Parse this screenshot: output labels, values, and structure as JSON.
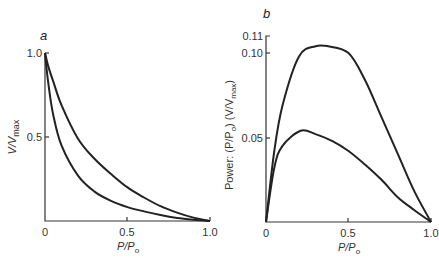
{
  "chart_data": [
    {
      "type": "line",
      "panel": "a",
      "title": "",
      "xlabel": "P/P₀",
      "ylabel": "V/V_max",
      "xlim": [
        0,
        1.0
      ],
      "ylim": [
        0,
        1.0
      ],
      "xticks": [
        "0",
        "0.5",
        "1.0"
      ],
      "yticks": [
        "0.5",
        "1.0"
      ],
      "grid": false,
      "series": [
        {
          "name": "upper curve (a≈0.33)",
          "x": [
            0,
            0.02,
            0.05,
            0.1,
            0.2,
            0.3,
            0.4,
            0.5,
            0.6,
            0.7,
            0.8,
            0.9,
            1.0
          ],
          "values": [
            1.0,
            0.92,
            0.83,
            0.69,
            0.49,
            0.37,
            0.28,
            0.2,
            0.14,
            0.088,
            0.05,
            0.02,
            0
          ]
        },
        {
          "name": "lower curve (a≈0.1)",
          "x": [
            0,
            0.02,
            0.05,
            0.1,
            0.2,
            0.3,
            0.4,
            0.5,
            0.6,
            0.7,
            0.8,
            0.9,
            1.0
          ],
          "values": [
            1.0,
            0.82,
            0.63,
            0.45,
            0.27,
            0.175,
            0.12,
            0.083,
            0.057,
            0.035,
            0.018,
            0.0075,
            0
          ]
        }
      ]
    },
    {
      "type": "line",
      "panel": "b",
      "title": "",
      "xlabel": "P/P₀",
      "ylabel": "Power: (P/P₀) (V/V_max)",
      "xlim": [
        0,
        1.0
      ],
      "ylim": [
        0,
        0.11
      ],
      "xticks": [
        "0",
        "0.5",
        "1.0"
      ],
      "yticks": [
        "0.05",
        "0.10",
        "0.11"
      ],
      "grid": false,
      "series": [
        {
          "name": "upper curve",
          "x": [
            0,
            0.05,
            0.1,
            0.2,
            0.3,
            0.375,
            0.5,
            0.6,
            0.7,
            0.8,
            0.9,
            1.0
          ],
          "values": [
            0,
            0.042,
            0.069,
            0.098,
            0.104,
            0.104,
            0.1,
            0.084,
            0.062,
            0.04,
            0.018,
            0
          ]
        },
        {
          "name": "lower curve",
          "x": [
            0,
            0.05,
            0.1,
            0.21,
            0.3,
            0.4,
            0.5,
            0.6,
            0.7,
            0.8,
            0.9,
            1.0
          ],
          "values": [
            0,
            0.032,
            0.045,
            0.054,
            0.052,
            0.048,
            0.042,
            0.034,
            0.025,
            0.0145,
            0.007,
            0
          ]
        }
      ]
    }
  ],
  "panels": {
    "a": {
      "label": "a",
      "xlabel_main": "P/P",
      "xlabel_sub": "o",
      "ylabel_main": "V/V",
      "ylabel_sub": "max",
      "xticks": [
        "0",
        "0.5",
        "1.0"
      ],
      "yticks": [
        "0.5",
        "1.0"
      ]
    },
    "b": {
      "label": "b",
      "xlabel_main": "P/P",
      "xlabel_sub": "o",
      "ylabel_pre": "Power: (P/P",
      "ylabel_sub1": "o",
      "ylabel_mid": ") (V/V",
      "ylabel_sub2": "max",
      "ylabel_post": ")",
      "xticks": [
        "0",
        "0.5",
        "1.0"
      ],
      "yticks": [
        "0.05",
        "0.10",
        "0.11"
      ]
    }
  }
}
